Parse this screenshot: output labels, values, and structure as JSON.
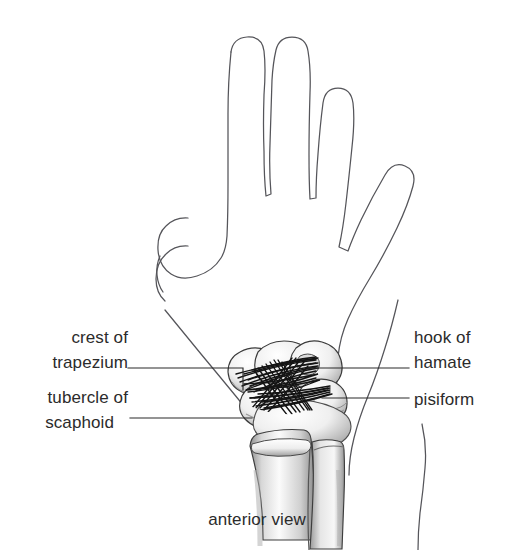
{
  "figure": {
    "caption": "anterior view",
    "background_color": "#ffffff",
    "ink_color": "#2b2b2b",
    "outline_color": "#55555a",
    "ligament_color": "#141414"
  },
  "labels": {
    "crest_of_trapezium": {
      "line1": "crest of",
      "line2": "trapezium",
      "side": "left",
      "leader": "elbowed"
    },
    "tubercle_of_scaphoid": {
      "line1": "tubercle of",
      "line2": "scaphoid",
      "side": "left",
      "leader": "straight"
    },
    "hook_of_hamate": {
      "line1": "hook of",
      "line2": "hamate",
      "side": "right",
      "leader": "straight"
    },
    "pisiform": {
      "line1": "pisiform",
      "side": "right",
      "leader": "straight"
    }
  },
  "anatomy": {
    "structures": [
      "hand outline",
      "thumb",
      "index finger",
      "middle finger",
      "ring finger",
      "little finger",
      "carpal bones",
      "flexor retinaculum",
      "radius",
      "ulna"
    ],
    "view": "anterior (palmar)"
  }
}
